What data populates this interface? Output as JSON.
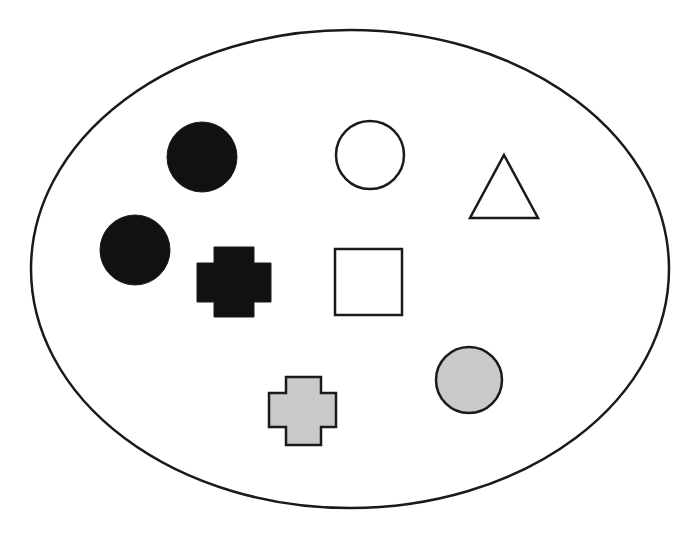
{
  "diagram": {
    "type": "set-of-shapes",
    "colors": {
      "background": "#ffffff",
      "stroke": "#1a1a1a",
      "black_fill": "#111111",
      "white_fill": "#ffffff",
      "gray_fill": "#c9c9c9"
    },
    "boundary": {
      "shape": "ellipse",
      "cx": 350,
      "cy": 269,
      "rx": 319,
      "ry": 239
    },
    "shapes": [
      {
        "id": "black-circle-1",
        "shape": "circle",
        "fill": "black",
        "cx": 202,
        "cy": 157,
        "r": 35
      },
      {
        "id": "white-circle",
        "shape": "circle",
        "fill": "white",
        "cx": 370,
        "cy": 155,
        "r": 34
      },
      {
        "id": "white-triangle",
        "shape": "triangle",
        "fill": "white",
        "points": "504,155 538,218 470,218"
      },
      {
        "id": "black-circle-2",
        "shape": "circle",
        "fill": "black",
        "cx": 135,
        "cy": 250,
        "r": 35
      },
      {
        "id": "black-cross",
        "shape": "cross",
        "fill": "black",
        "x": 197,
        "y": 247,
        "w": 74,
        "h": 70,
        "arm_x": 214,
        "arm_w": 40,
        "arm_y": 263,
        "arm_h": 39
      },
      {
        "id": "white-square",
        "shape": "square",
        "fill": "white",
        "x": 335,
        "y": 249,
        "w": 67,
        "h": 66
      },
      {
        "id": "gray-circle",
        "shape": "circle",
        "fill": "gray",
        "cx": 469,
        "cy": 380,
        "r": 33
      },
      {
        "id": "gray-cross",
        "shape": "cross",
        "fill": "gray",
        "x": 269,
        "y": 377,
        "w": 67,
        "h": 68,
        "arm_x": 286,
        "arm_w": 35,
        "arm_y": 393,
        "arm_h": 34
      }
    ],
    "counts": {
      "black": 3,
      "white": 3,
      "gray": 2,
      "circles": 4,
      "crosses": 2,
      "squares": 1,
      "triangles": 1,
      "total": 8
    }
  }
}
